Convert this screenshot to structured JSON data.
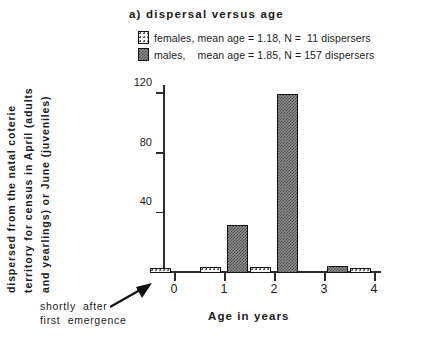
{
  "title": "a)  dispersal  versus  age",
  "legend": {
    "items": [
      {
        "label": "females, mean age = 1.18, N =  11 dispersers",
        "swatch": "dotted-light-swatch"
      },
      {
        "label": "males,    mean age = 1.85, N = 157 dispersers",
        "swatch": "hatched-dark-swatch"
      }
    ]
  },
  "axes": {
    "x_title": "Age  in  years",
    "y_title_lines": [
      "Number  of  individuals  that  had",
      "dispersed  from  the  natal  coterie",
      "territory  for  census  in  April  (adults",
      "and  yearlings)  or  June  (juveniles)"
    ]
  },
  "annotation": {
    "line1": "shortly  after",
    "line2": "first  emergence"
  },
  "chart_data": {
    "type": "bar",
    "title": "a)  dispersal  versus  age",
    "xlabel": "Age  in  years",
    "ylabel": "Number of individuals that had dispersed from the natal coterie territory for census in April (adults and yearlings) or June (juveniles)",
    "categories": [
      "0",
      "1",
      "2",
      "3",
      "4"
    ],
    "xticks": [
      "0",
      "1",
      "2",
      "3",
      "4"
    ],
    "yticks": [
      0,
      40,
      80,
      120
    ],
    "ylim": [
      0,
      126
    ],
    "grid": false,
    "legend_position": "top-left",
    "series": [
      {
        "name": "females, mean age = 1.18, N = 11 dispersers",
        "values": [
          3,
          4,
          4,
          0,
          2
        ],
        "color": "#f7f7f7",
        "pattern": "dotted"
      },
      {
        "name": "males, mean age = 1.85, N = 157 dispersers",
        "values": [
          0,
          32,
          120,
          5,
          0
        ],
        "color": "#8e8e8e",
        "pattern": "hatched"
      }
    ],
    "annotations": [
      {
        "text": "shortly after first emergence",
        "points_to": "x=0"
      }
    ]
  }
}
